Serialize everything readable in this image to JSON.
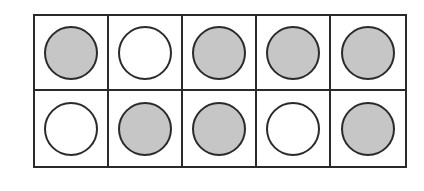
{
  "diagram": {
    "type": "ten-frame",
    "rows": 2,
    "columns": 5,
    "cells": [
      {
        "row": 1,
        "col": 1,
        "state": "filled"
      },
      {
        "row": 1,
        "col": 2,
        "state": "empty"
      },
      {
        "row": 1,
        "col": 3,
        "state": "filled"
      },
      {
        "row": 1,
        "col": 4,
        "state": "filled"
      },
      {
        "row": 1,
        "col": 5,
        "state": "filled"
      },
      {
        "row": 2,
        "col": 1,
        "state": "empty"
      },
      {
        "row": 2,
        "col": 2,
        "state": "filled"
      },
      {
        "row": 2,
        "col": 3,
        "state": "filled"
      },
      {
        "row": 2,
        "col": 4,
        "state": "empty"
      },
      {
        "row": 2,
        "col": 5,
        "state": "filled"
      }
    ],
    "filled_count": 7,
    "empty_count": 3,
    "colors": {
      "border": "#2a2a2a",
      "filled": "#c6c6c6",
      "empty": "#ffffff"
    }
  }
}
